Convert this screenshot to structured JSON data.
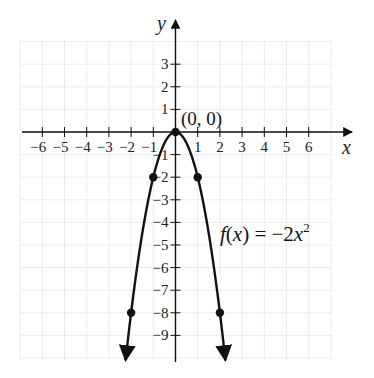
{
  "chart_data": {
    "type": "line",
    "title": "",
    "xlabel": "x",
    "ylabel": "y",
    "xlim": [
      -7,
      7.5
    ],
    "ylim": [
      -10,
      4.5
    ],
    "grid": true,
    "x_ticks": [
      -6,
      -5,
      -4,
      -3,
      -2,
      -1,
      1,
      2,
      3,
      4,
      5,
      6
    ],
    "y_ticks": [
      3,
      2,
      1,
      -1,
      -2,
      -3,
      -4,
      -5,
      -6,
      -7,
      -8,
      -9
    ],
    "x_tick_labels": [
      "−6",
      "−5",
      "−4",
      "−3",
      "−2",
      "−1",
      "1",
      "2",
      "3",
      "4",
      "5",
      "6"
    ],
    "y_tick_labels": [
      "3",
      "2",
      "1",
      "−1",
      "−2",
      "−3",
      "−4",
      "−5",
      "−6",
      "−7",
      "−8",
      "−9"
    ],
    "series": [
      {
        "name": "f(x) = −2x²",
        "function": "-2*x^2",
        "x": [
          -2,
          -1,
          0,
          1,
          2
        ],
        "y": [
          -8,
          -2,
          0,
          -2,
          -8
        ],
        "marked_points": true,
        "color": "#111111"
      }
    ],
    "annotations": [
      {
        "text": "(0, 0)",
        "x": 0,
        "y": 0
      },
      {
        "text": "f(x) = −2x²",
        "x": 2.1,
        "y": -4.7
      }
    ]
  },
  "labels": {
    "x_axis": "x",
    "y_axis": "y",
    "vertex": "(0, 0)",
    "func_f": "f",
    "func_paren_open": "(",
    "func_var": "x",
    "func_rest": ") = −2",
    "func_x": "x",
    "func_exp": "2"
  }
}
